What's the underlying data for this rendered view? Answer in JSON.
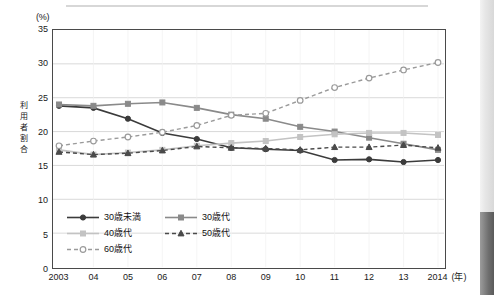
{
  "chart_data": {
    "type": "line",
    "title": "",
    "unit_label": "(%)",
    "ylabel": "利用者割合",
    "xlabel": "(年)",
    "ylim": [
      0,
      35
    ],
    "ytick_step": 5,
    "yticks": [
      0,
      5,
      10,
      15,
      20,
      25,
      30,
      35
    ],
    "grid": true,
    "legend_position": "inside-bottom-left",
    "categories": [
      "2003",
      "04",
      "05",
      "06",
      "07",
      "08",
      "09",
      "10",
      "11",
      "12",
      "13",
      "2014"
    ],
    "series": [
      {
        "name": "30歳未満",
        "color": "#3b3b3b",
        "style": "solid",
        "marker": "circle-filled",
        "values": [
          23.8,
          23.5,
          21.9,
          19.8,
          18.9,
          17.6,
          17.4,
          17.2,
          15.8,
          15.9,
          15.5,
          15.8
        ]
      },
      {
        "name": "30歳代",
        "color": "#8a8a8a",
        "style": "solid",
        "marker": "square-filled",
        "values": [
          24.0,
          23.8,
          24.1,
          24.3,
          23.5,
          22.5,
          21.9,
          20.7,
          20.0,
          19.1,
          18.2,
          17.3
        ]
      },
      {
        "name": "40歳代",
        "color": "#c3c3c3",
        "style": "solid",
        "marker": "square-filled",
        "values": [
          17.3,
          16.6,
          16.9,
          17.3,
          17.9,
          18.3,
          18.6,
          19.2,
          19.6,
          19.8,
          19.8,
          19.5
        ]
      },
      {
        "name": "50歳代",
        "color": "#4a4a4a",
        "style": "dashed",
        "marker": "triangle-filled",
        "values": [
          17.0,
          16.6,
          16.8,
          17.2,
          17.8,
          17.6,
          17.5,
          17.3,
          17.7,
          17.7,
          18.0,
          17.6
        ]
      },
      {
        "name": "60歳代",
        "color": "#9a9a9a",
        "style": "dashed",
        "marker": "circle-open",
        "values": [
          17.9,
          18.6,
          19.2,
          19.9,
          20.9,
          22.4,
          22.7,
          24.6,
          26.5,
          27.9,
          29.1,
          30.2
        ]
      }
    ]
  },
  "legend": {
    "items": [
      {
        "label": "30歳未満"
      },
      {
        "label": "30歳代"
      },
      {
        "label": "40歳代"
      },
      {
        "label": "50歳代"
      },
      {
        "label": "60歳代"
      }
    ]
  }
}
